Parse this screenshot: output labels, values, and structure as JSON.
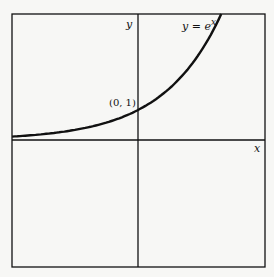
{
  "chart_data": {
    "type": "line",
    "title": "",
    "xlabel": "x",
    "ylabel": "y",
    "series": [
      {
        "name": "y = e^x",
        "function": "exp(x)",
        "x": [
          -2.17,
          -2,
          -1.5,
          -1,
          -0.5,
          0,
          0.5,
          1,
          1.2,
          1.435
        ],
        "values": [
          0.114,
          0.135,
          0.223,
          0.368,
          0.607,
          1.0,
          1.649,
          2.718,
          3.32,
          4.2
        ]
      }
    ],
    "annotations": [
      {
        "text": "(0, 1)",
        "x": 0,
        "y": 1
      }
    ],
    "xlim": [
      -2.17,
      2.19
    ],
    "ylim": [
      -4.23,
      4.2
    ],
    "grid": false,
    "legend": "none"
  },
  "labels": {
    "y_axis": "y",
    "x_axis": "x",
    "curve": "y = e",
    "curve_exp": "x",
    "point": "(0, 1)"
  }
}
